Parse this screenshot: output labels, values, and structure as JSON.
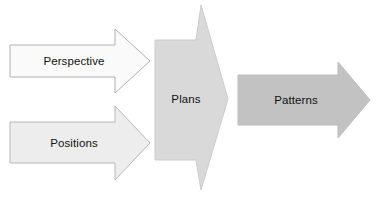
{
  "diagram": {
    "type": "process-flow",
    "background_color": "#ffffff",
    "width": 380,
    "height": 201,
    "nodes": [
      {
        "id": "perspective",
        "label": "Perspective",
        "shape": "right-arrow",
        "fill_color": "#fafafa",
        "stroke_color": "#b0b0b0",
        "text_color": "#111111",
        "label_x": 74,
        "label_y": 61
      },
      {
        "id": "positions",
        "label": "Positions",
        "shape": "right-arrow",
        "fill_color": "#ededed",
        "stroke_color": "#b8b8b8",
        "text_color": "#111111",
        "label_x": 74,
        "label_y": 143
      },
      {
        "id": "plans",
        "label": "Plans",
        "shape": "tall-chevron-arrow",
        "fill_color": "#d9d9d9",
        "stroke_color": "#cccccc",
        "text_color": "#111111",
        "label_x": 188,
        "label_y": 99
      },
      {
        "id": "patterns",
        "label": "Patterns",
        "shape": "right-arrow",
        "fill_color": "#c2c2c2",
        "stroke_color": "#bcbcbc",
        "text_color": "#111111",
        "label_x": 296,
        "label_y": 100
      }
    ],
    "flow_order": [
      "perspective",
      "positions",
      "plans",
      "patterns"
    ]
  }
}
